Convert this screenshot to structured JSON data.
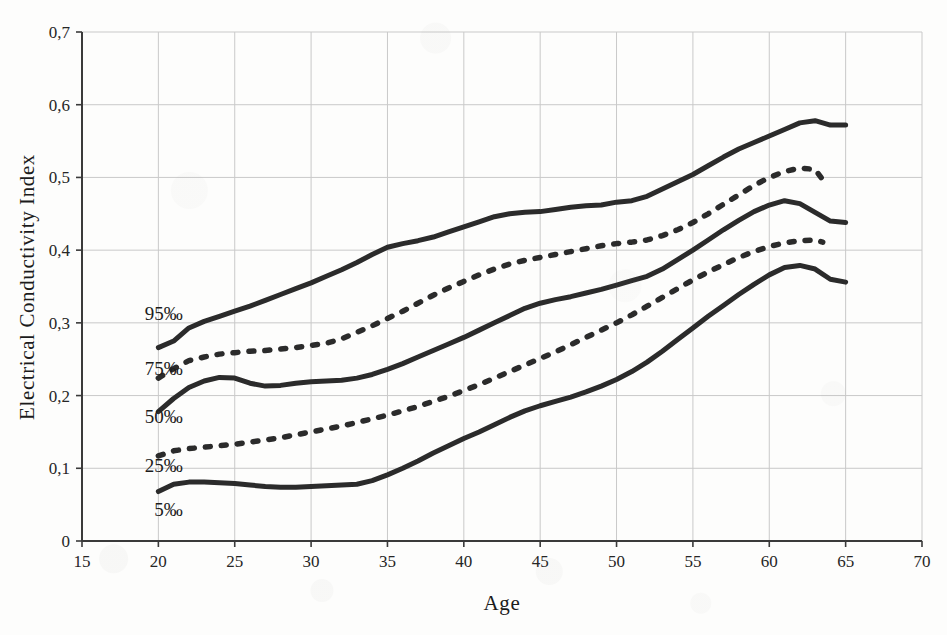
{
  "chart_data": {
    "type": "line",
    "title": "",
    "xlabel": "Age",
    "ylabel": "Electrical Conductivity Index",
    "xlim": [
      15,
      70
    ],
    "ylim": [
      0,
      0.7
    ],
    "x_ticks": [
      "15",
      "20",
      "25",
      "30",
      "35",
      "40",
      "45",
      "50",
      "55",
      "60",
      "65",
      "70"
    ],
    "x_tick_values": [
      15,
      20,
      25,
      30,
      35,
      40,
      45,
      50,
      55,
      60,
      65,
      70
    ],
    "y_ticks": [
      "0",
      "0,1",
      "0,2",
      "0,3",
      "0,4",
      "0,5",
      "0,6",
      "0,7"
    ],
    "y_tick_values": [
      0,
      0.1,
      0.2,
      0.3,
      0.4,
      0.5,
      0.6,
      0.7
    ],
    "grid": true,
    "legend_position": "inline-left",
    "decimal_separator": ",",
    "line_color": "#2b2b2b",
    "grid_color": "#c9c9c9",
    "axis_color": "#3a3a3a",
    "series": [
      {
        "name": "95‰",
        "label": "95‰",
        "style": "solid",
        "label_x": 21.6,
        "label_y": 0.312,
        "x": [
          20,
          21,
          22,
          23,
          24,
          25,
          26,
          27,
          28,
          29,
          30,
          31,
          32,
          33,
          34,
          35,
          36,
          37,
          38,
          39,
          40,
          41,
          42,
          43,
          44,
          45,
          46,
          47,
          48,
          49,
          50,
          51,
          52,
          53,
          54,
          55,
          56,
          57,
          58,
          59,
          60,
          61,
          62,
          63,
          64,
          65
        ],
        "values": [
          0.266,
          0.275,
          0.293,
          0.302,
          0.309,
          0.316,
          0.323,
          0.331,
          0.339,
          0.347,
          0.355,
          0.364,
          0.373,
          0.383,
          0.394,
          0.404,
          0.409,
          0.413,
          0.418,
          0.425,
          0.432,
          0.439,
          0.446,
          0.45,
          0.452,
          0.453,
          0.456,
          0.459,
          0.461,
          0.462,
          0.466,
          0.468,
          0.474,
          0.484,
          0.494,
          0.504,
          0.516,
          0.528,
          0.539,
          0.548,
          0.557,
          0.566,
          0.575,
          0.578,
          0.572,
          0.572
        ]
      },
      {
        "name": "75‰",
        "label": "75‰",
        "style": "dashed",
        "label_x": 21.6,
        "label_y": 0.236,
        "x": [
          20,
          21,
          22,
          23,
          24,
          25,
          26,
          27,
          28,
          29,
          30,
          31,
          32,
          33,
          34,
          35,
          36,
          37,
          38,
          39,
          40,
          41,
          42,
          43,
          44,
          45,
          46,
          47,
          48,
          49,
          50,
          51,
          52,
          53,
          54,
          55,
          56,
          57,
          58,
          59,
          60,
          61,
          62,
          63,
          63.5
        ],
        "values": [
          0.224,
          0.237,
          0.248,
          0.253,
          0.257,
          0.259,
          0.261,
          0.262,
          0.264,
          0.266,
          0.269,
          0.272,
          0.278,
          0.287,
          0.296,
          0.306,
          0.316,
          0.327,
          0.338,
          0.348,
          0.357,
          0.366,
          0.374,
          0.381,
          0.386,
          0.39,
          0.394,
          0.398,
          0.402,
          0.406,
          0.409,
          0.411,
          0.414,
          0.42,
          0.428,
          0.438,
          0.45,
          0.463,
          0.476,
          0.489,
          0.5,
          0.508,
          0.513,
          0.511,
          0.497
        ]
      },
      {
        "name": "50‰",
        "label": "50‰",
        "style": "solid",
        "label_x": 21.6,
        "label_y": 0.17,
        "x": [
          20,
          21,
          22,
          23,
          24,
          25,
          26,
          27,
          28,
          29,
          30,
          31,
          32,
          33,
          34,
          35,
          36,
          37,
          38,
          39,
          40,
          41,
          42,
          43,
          44,
          45,
          46,
          47,
          48,
          49,
          50,
          51,
          52,
          53,
          54,
          55,
          56,
          57,
          58,
          59,
          60,
          61,
          62,
          63,
          64,
          65
        ],
        "values": [
          0.178,
          0.196,
          0.211,
          0.22,
          0.225,
          0.224,
          0.217,
          0.213,
          0.214,
          0.217,
          0.219,
          0.22,
          0.221,
          0.224,
          0.229,
          0.236,
          0.244,
          0.253,
          0.262,
          0.271,
          0.28,
          0.29,
          0.3,
          0.31,
          0.32,
          0.327,
          0.332,
          0.336,
          0.341,
          0.346,
          0.352,
          0.358,
          0.364,
          0.374,
          0.387,
          0.4,
          0.414,
          0.428,
          0.441,
          0.453,
          0.462,
          0.468,
          0.464,
          0.452,
          0.44,
          0.438
        ]
      },
      {
        "name": "25‰",
        "label": "25‰",
        "style": "dashed",
        "label_x": 21.6,
        "label_y": 0.103,
        "x": [
          20,
          21,
          22,
          23,
          24,
          25,
          26,
          27,
          28,
          29,
          30,
          31,
          32,
          33,
          34,
          35,
          36,
          37,
          38,
          39,
          40,
          41,
          42,
          43,
          44,
          45,
          46,
          47,
          48,
          49,
          50,
          51,
          52,
          53,
          54,
          55,
          56,
          57,
          58,
          59,
          60,
          61,
          62,
          63,
          63.5
        ],
        "values": [
          0.117,
          0.124,
          0.127,
          0.129,
          0.131,
          0.133,
          0.136,
          0.139,
          0.142,
          0.146,
          0.15,
          0.154,
          0.158,
          0.163,
          0.168,
          0.173,
          0.179,
          0.185,
          0.192,
          0.199,
          0.207,
          0.215,
          0.224,
          0.233,
          0.242,
          0.251,
          0.26,
          0.27,
          0.28,
          0.29,
          0.3,
          0.311,
          0.323,
          0.335,
          0.347,
          0.359,
          0.37,
          0.38,
          0.39,
          0.398,
          0.405,
          0.41,
          0.413,
          0.414,
          0.411
        ]
      },
      {
        "name": "5‰",
        "label": "5‰",
        "style": "solid",
        "label_x": 21.6,
        "label_y": 0.042,
        "x": [
          20,
          21,
          22,
          23,
          24,
          25,
          26,
          27,
          28,
          29,
          30,
          31,
          32,
          33,
          34,
          35,
          36,
          37,
          38,
          39,
          40,
          41,
          42,
          43,
          44,
          45,
          46,
          47,
          48,
          49,
          50,
          51,
          52,
          53,
          54,
          55,
          56,
          57,
          58,
          59,
          60,
          61,
          62,
          63,
          64,
          65
        ],
        "values": [
          0.068,
          0.078,
          0.081,
          0.081,
          0.08,
          0.079,
          0.077,
          0.075,
          0.074,
          0.074,
          0.075,
          0.076,
          0.077,
          0.078,
          0.083,
          0.091,
          0.1,
          0.11,
          0.121,
          0.131,
          0.141,
          0.15,
          0.16,
          0.17,
          0.179,
          0.186,
          0.192,
          0.198,
          0.205,
          0.213,
          0.222,
          0.233,
          0.246,
          0.261,
          0.277,
          0.293,
          0.309,
          0.324,
          0.339,
          0.353,
          0.366,
          0.376,
          0.379,
          0.374,
          0.36,
          0.356
        ]
      }
    ]
  }
}
